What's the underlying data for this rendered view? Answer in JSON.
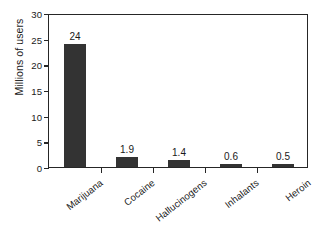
{
  "chart_data": {
    "type": "bar",
    "title": "",
    "subtitle": "",
    "xlabel": "",
    "ylabel": "Millions of users",
    "categories": [
      "Marijuana",
      "Cocaine",
      "Hallucinogens",
      "Inhalants",
      "Heroin"
    ],
    "values": [
      24,
      1.9,
      1.4,
      0.6,
      0.5
    ],
    "value_labels": [
      "24",
      "1.9",
      "1.4",
      "0.6",
      "0.5"
    ],
    "ylim": [
      0,
      30
    ],
    "yticks": [
      0,
      5,
      10,
      15,
      20,
      25,
      30
    ],
    "ytick_labels": [
      "0",
      "5",
      "10",
      "15",
      "20",
      "25",
      "30"
    ],
    "grid": false,
    "legend": false,
    "legend_position": "none",
    "bar_color": "#333333",
    "axis_color": "#262626",
    "text_color": "#1a1a1a",
    "background_color": "#ffffff"
  }
}
